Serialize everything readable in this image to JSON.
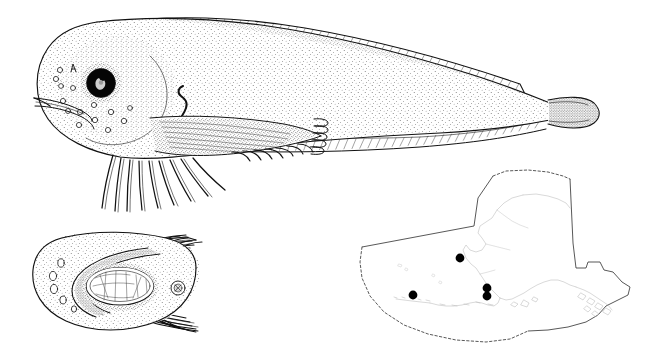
{
  "plate": {
    "title": "Snailfish plate",
    "background_color": "#ffffff",
    "ink_color": "#111111",
    "coastline_color": "#b9b9b9",
    "locality_dot_color": "#000000",
    "width": 654,
    "height": 359
  },
  "figures": [
    {
      "id": "lateral-view",
      "name": "Lateral view of fish",
      "description": "Whole-body lateral illustration, head at left, tapering tail at right",
      "features": [
        "large round black eye with white highlight",
        "stippled body shading",
        "cephalic sensory pores on head",
        "gill opening slit above pectoral fin",
        "long dorsal fin band along entire back",
        "anal fin band along lower body",
        "pectoral fin with upper lobe and free lower rays",
        "small rounded darkly stippled caudal fin"
      ]
    },
    {
      "id": "ventral-head-view",
      "name": "Ventral view of head",
      "description": "Head viewed from below showing pelvic sucking disc, mouth, pores and pectoral rays",
      "features": [
        "oval pelvic sucking disc",
        "mouth arc",
        "mandibular pores",
        "anus shown as small stippled circle",
        "pectoral fin rays fanning posteriorly"
      ]
    },
    {
      "id": "distribution-map",
      "name": "Alaska distribution map",
      "description": "Outline map of Alaska with EEZ boundary and collection locality dots",
      "boundary_styles": {
        "north_boundary": "dashed",
        "east_boundary": "solid",
        "northwest_boundary": "solid",
        "southern_boundary": "dashed"
      },
      "locality_count": 4,
      "localities": [
        {
          "label": "northern Bering Sea record",
          "x": 460,
          "y": 258
        },
        {
          "label": "western Aleutian record",
          "x": 413,
          "y": 295
        },
        {
          "label": "Alaska Peninsula record a",
          "x": 487,
          "y": 288
        },
        {
          "label": "Alaska Peninsula record b",
          "x": 487,
          "y": 296
        }
      ]
    }
  ]
}
